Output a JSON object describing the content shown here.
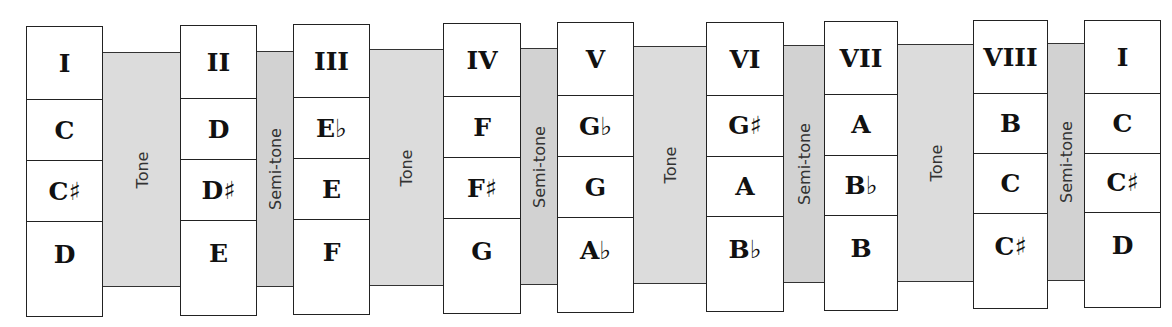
{
  "degrees": [
    {
      "numeral": "I",
      "notes": [
        "C",
        "C♯",
        "D"
      ]
    },
    {
      "numeral": "II",
      "notes": [
        "D",
        "D♯",
        "E"
      ]
    },
    {
      "numeral": "III",
      "notes": [
        "E♭",
        "E",
        "F"
      ]
    },
    {
      "numeral": "IV",
      "notes": [
        "F",
        "F♯",
        "G"
      ]
    },
    {
      "numeral": "V",
      "notes": [
        "G♭",
        "G",
        "A♭"
      ]
    },
    {
      "numeral": "VI",
      "notes": [
        "G♯",
        "A",
        "B♭"
      ]
    },
    {
      "numeral": "VII",
      "notes": [
        "A",
        "B♭",
        "B"
      ]
    },
    {
      "numeral": "VIII",
      "notes": [
        "B",
        "C",
        "C♯"
      ]
    },
    {
      "numeral": "I",
      "notes": [
        "C",
        "C♯",
        "D"
      ]
    }
  ],
  "intervals": [
    "Tone",
    "Semi-tone",
    "Tone",
    "Semi-tone",
    "Tone",
    "Semi-tone",
    "Tone",
    "Semi-tone"
  ],
  "colors": {
    "band_tone": "#dcdcdc",
    "band_semitone": "#d2d2d2",
    "border": "#222222"
  }
}
